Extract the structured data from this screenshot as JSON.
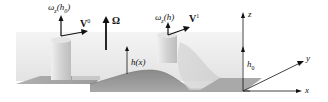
{
  "diagram": {
    "labels": {
      "omega_left": "ω",
      "omega_left_sub": "z",
      "omega_left_arg": "(h",
      "omega_left_arg_sub": "0",
      "omega_left_close": ")",
      "v0": "V",
      "v0_sup": "0",
      "Omega": "Ω",
      "omega_right": "ω",
      "omega_right_sub": "z",
      "omega_right_arg": "(h)",
      "v1": "V",
      "v1_sup": "1",
      "hx": "h(x)",
      "h0": "h",
      "h0_sub": "0",
      "z_axis": "z",
      "y_axis": "y",
      "x_axis": "x"
    },
    "colors": {
      "fluid_top": "#e6e6e6",
      "fluid_front": "#dcdcdc",
      "bottom": "#9a9a9a",
      "bump": "#7e7e7e",
      "column": "#cfcfcf",
      "arrow": "#111111"
    }
  }
}
